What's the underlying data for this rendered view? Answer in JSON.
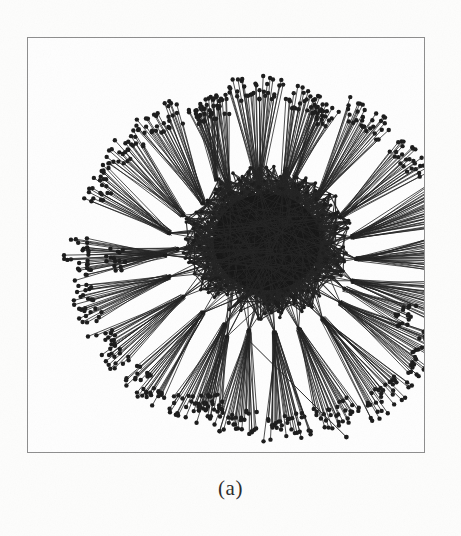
{
  "figure": {
    "caption": "(a)",
    "panel_label": "a",
    "frame": {
      "x": 27,
      "y": 37,
      "width": 398,
      "height": 416,
      "border_color": "#8d8d8d"
    },
    "background_color": "#fdfdfc",
    "ink_color": "#1a1a1a"
  },
  "chart_data": {
    "type": "scatter",
    "title": "",
    "subtitle": "",
    "xlabel": "",
    "ylabel": "",
    "legend": [],
    "grid": false,
    "annotations": [
      "(a)"
    ],
    "layout": "radial-force-directed",
    "core": {
      "cx": 240,
      "cy": 205,
      "rx": 86,
      "ry": 78,
      "fill": "#141414"
    },
    "node_radius": 2.2,
    "edge_width": 0.85,
    "node_color": "#1a1a1a",
    "edge_color": "#222222",
    "counts": {
      "hubs": 26,
      "fan_leaves": 742,
      "outlier_nodes": 1,
      "core_nodes": 420
    },
    "outlier": {
      "x": 320,
      "y": 401,
      "anchor_x": 218,
      "anchor_y": 300,
      "label": ""
    },
    "hubs": [
      {
        "cx": 232,
        "cy": 150,
        "angle": -92,
        "spread": 15,
        "count": 34,
        "len_min": 88,
        "len_max": 112
      },
      {
        "cx": 256,
        "cy": 152,
        "angle": -74,
        "spread": 13,
        "count": 30,
        "len_min": 80,
        "len_max": 105
      },
      {
        "cx": 203,
        "cy": 156,
        "angle": -104,
        "spread": 13,
        "count": 28,
        "len_min": 76,
        "len_max": 100
      },
      {
        "cx": 176,
        "cy": 166,
        "angle": -118,
        "spread": 14,
        "count": 30,
        "len_min": 82,
        "len_max": 108
      },
      {
        "cx": 156,
        "cy": 178,
        "angle": -132,
        "spread": 13,
        "count": 26,
        "len_min": 76,
        "len_max": 102
      },
      {
        "cx": 142,
        "cy": 196,
        "angle": -146,
        "spread": 12,
        "count": 24,
        "len_min": 70,
        "len_max": 96
      },
      {
        "cx": 290,
        "cy": 162,
        "angle": -58,
        "spread": 14,
        "count": 32,
        "len_min": 84,
        "len_max": 110
      },
      {
        "cx": 314,
        "cy": 180,
        "angle": -40,
        "spread": 13,
        "count": 28,
        "len_min": 80,
        "len_max": 104
      },
      {
        "cx": 326,
        "cy": 200,
        "angle": -20,
        "spread": 14,
        "count": 34,
        "len_min": 86,
        "len_max": 114
      },
      {
        "cx": 330,
        "cy": 222,
        "angle": -4,
        "spread": 13,
        "count": 30,
        "len_min": 80,
        "len_max": 106
      },
      {
        "cx": 326,
        "cy": 244,
        "angle": 14,
        "spread": 13,
        "count": 28,
        "len_min": 78,
        "len_max": 102
      },
      {
        "cx": 314,
        "cy": 266,
        "angle": 32,
        "spread": 14,
        "count": 32,
        "len_min": 84,
        "len_max": 110
      },
      {
        "cx": 296,
        "cy": 282,
        "angle": 50,
        "spread": 14,
        "count": 34,
        "len_min": 88,
        "len_max": 116
      },
      {
        "cx": 272,
        "cy": 292,
        "angle": 66,
        "spread": 13,
        "count": 30,
        "len_min": 82,
        "len_max": 108
      },
      {
        "cx": 248,
        "cy": 296,
        "angle": 82,
        "spread": 13,
        "count": 32,
        "len_min": 84,
        "len_max": 110
      },
      {
        "cx": 222,
        "cy": 294,
        "angle": 98,
        "spread": 13,
        "count": 30,
        "len_min": 80,
        "len_max": 106
      },
      {
        "cx": 198,
        "cy": 288,
        "angle": 112,
        "spread": 13,
        "count": 28,
        "len_min": 78,
        "len_max": 104
      },
      {
        "cx": 176,
        "cy": 276,
        "angle": 128,
        "spread": 13,
        "count": 30,
        "len_min": 82,
        "len_max": 108
      },
      {
        "cx": 156,
        "cy": 260,
        "angle": 144,
        "spread": 13,
        "count": 28,
        "len_min": 78,
        "len_max": 104
      },
      {
        "cx": 142,
        "cy": 240,
        "angle": 162,
        "spread": 13,
        "count": 26,
        "len_min": 74,
        "len_max": 100
      },
      {
        "cx": 138,
        "cy": 218,
        "angle": 178,
        "spread": 13,
        "count": 28,
        "len_min": 76,
        "len_max": 102
      },
      {
        "cx": 190,
        "cy": 142,
        "angle": -98,
        "spread": 10,
        "count": 18,
        "len_min": 60,
        "len_max": 82
      },
      {
        "cx": 268,
        "cy": 140,
        "angle": -66,
        "spread": 10,
        "count": 18,
        "len_min": 58,
        "len_max": 80
      },
      {
        "cx": 318,
        "cy": 252,
        "angle": 24,
        "spread": 10,
        "count": 16,
        "len_min": 56,
        "len_max": 76
      },
      {
        "cx": 200,
        "cy": 300,
        "angle": 104,
        "spread": 10,
        "count": 18,
        "len_min": 58,
        "len_max": 80
      },
      {
        "cx": 150,
        "cy": 212,
        "angle": 170,
        "spread": 10,
        "count": 16,
        "len_min": 54,
        "len_max": 74
      }
    ]
  }
}
